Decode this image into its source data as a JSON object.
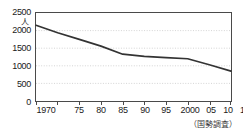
{
  "chart_data": {
    "type": "line",
    "title": "",
    "subtitle": "",
    "xlabel": "",
    "ylabel": "人",
    "y_unit_label": "人",
    "x_unit_suffix": "年",
    "source_note": "（国勢調査）",
    "categories": [
      "1970",
      "75",
      "80",
      "85",
      "90",
      "95",
      "2000",
      "05",
      "10",
      "15"
    ],
    "x_tick_labels": [
      "1970",
      "75",
      "80",
      "85",
      "90",
      "95",
      "2000",
      "05",
      "10",
      "15年"
    ],
    "x": [
      1970,
      1975,
      1980,
      1985,
      1990,
      1995,
      2000,
      2005,
      2010,
      2015
    ],
    "values": [
      2150,
      1940,
      1750,
      1560,
      1330,
      1270,
      1230,
      1200,
      1030,
      850
    ],
    "series": [
      {
        "name": "人口",
        "values": [
          2150,
          1940,
          1750,
          1560,
          1330,
          1270,
          1230,
          1200,
          1030,
          850
        ]
      }
    ],
    "ylim": [
      0,
      2500
    ],
    "y_ticks": [
      2500,
      2000,
      1500,
      1000,
      500,
      0
    ],
    "y_tick_labels": [
      "2500",
      "2000",
      "1500",
      "1000",
      "500",
      "0"
    ],
    "xlim": [
      1970,
      2015
    ],
    "grid": true,
    "grid_axis": "y",
    "grid_style": "dotted",
    "legend": false,
    "legend_position": "none",
    "colors": {
      "line": "#333333",
      "frame": "#4a4a4a",
      "grid": "#c8c8c8",
      "background": "#ffffff",
      "text": "#1a1a1a"
    }
  }
}
